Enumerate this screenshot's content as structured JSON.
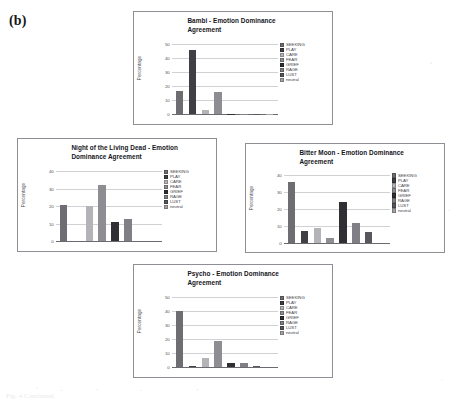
{
  "figure": {
    "panel_label": "(b)",
    "caption_fragment": "Fig. 4 Continued."
  },
  "legend_categories": [
    "SEEKING",
    "PLAY",
    "CARE",
    "FEAR",
    "GRIEF",
    "RAGE",
    "LUST",
    "neutral"
  ],
  "legend_colors": [
    "#6e6e72",
    "#3f3f44",
    "#b4b4b8",
    "#8d8d92",
    "#2f2f34",
    "#7f7f85",
    "#57575d",
    "#a2a2a7"
  ],
  "axis": {
    "ylabel": "Percentage"
  },
  "chart_data": [
    {
      "type": "bar",
      "id": "bambi",
      "title": "Bambi - Emotion Dominance Agreement",
      "title_line1": "Bambi - Emotion Dominance",
      "title_line2": "Agreement",
      "categories": [
        "SEEKING",
        "PLAY",
        "CARE",
        "FEAR",
        "GRIEF",
        "RAGE",
        "LUST",
        "neutral"
      ],
      "values": [
        17,
        46,
        3,
        16,
        0.5,
        0.5,
        0.5,
        0.5
      ],
      "xlabel": "",
      "ylabel": "Percentage",
      "ylim": [
        0,
        50
      ],
      "yticks": [
        0,
        10,
        20,
        30,
        40,
        50
      ],
      "ytick_labels": [
        "0",
        "10",
        "20",
        "30",
        "40",
        "50"
      ],
      "grid": true,
      "legend_position": "right"
    },
    {
      "type": "bar",
      "id": "night-of-the-living-dead",
      "title": "Night of the Living Dead - Emotion Dominance Agreement",
      "title_line1": "Night of the Living Dead - Emotion",
      "title_line2": "Dominance Agreement",
      "categories": [
        "SEEKING",
        "PLAY",
        "CARE",
        "FEAR",
        "GRIEF",
        "RAGE",
        "LUST",
        "neutral"
      ],
      "values": [
        21,
        0,
        20,
        32,
        11,
        13,
        0,
        0
      ],
      "xlabel": "",
      "ylabel": "Percentage",
      "ylim": [
        0,
        40
      ],
      "yticks": [
        0,
        10,
        20,
        30,
        40
      ],
      "ytick_labels": [
        "0",
        "10",
        "20",
        "30",
        "40"
      ],
      "grid": true,
      "legend_position": "right"
    },
    {
      "type": "bar",
      "id": "bitter-moon",
      "title": "Bitter Moon - Emotion Dominance Agreement",
      "title_line1": "Bitter Moon - Emotion Dominance",
      "title_line2": "Agreement",
      "categories": [
        "SEEKING",
        "PLAY",
        "CARE",
        "FEAR",
        "GRIEF",
        "RAGE",
        "LUST",
        "neutral"
      ],
      "values": [
        36,
        7,
        8.5,
        3,
        24,
        11.5,
        6.5,
        0
      ],
      "xlabel": "",
      "ylabel": "Percentage",
      "ylim": [
        0,
        40
      ],
      "yticks": [
        0,
        10,
        20,
        30,
        40
      ],
      "ytick_labels": [
        "0",
        "10",
        "20",
        "30",
        "40"
      ],
      "grid": true,
      "legend_position": "right"
    },
    {
      "type": "bar",
      "id": "psycho",
      "title": "Psycho - Emotion Dominance Agreement",
      "title_line1": "Psycho - Emotion Dominance",
      "title_line2": "Agreement",
      "categories": [
        "SEEKING",
        "PLAY",
        "CARE",
        "FEAR",
        "GRIEF",
        "RAGE",
        "LUST",
        "neutral"
      ],
      "values": [
        40,
        1,
        7,
        19,
        3,
        3,
        1,
        0
      ],
      "xlabel": "",
      "ylabel": "Percentage",
      "ylim": [
        0,
        50
      ],
      "yticks": [
        0,
        10,
        20,
        30,
        40,
        50
      ],
      "ytick_labels": [
        "0",
        "10",
        "20",
        "30",
        "40",
        "50"
      ],
      "grid": true,
      "legend_position": "right"
    }
  ]
}
